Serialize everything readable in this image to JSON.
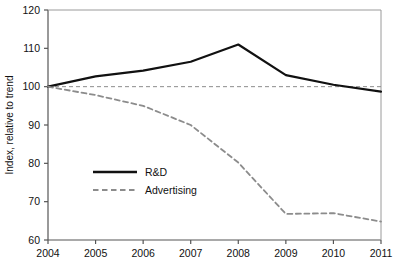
{
  "chart_data": {
    "type": "line",
    "title": "",
    "xlabel": "",
    "ylabel": "Index, relative to trend",
    "x": [
      2004,
      2005,
      2006,
      2007,
      2008,
      2009,
      2010,
      2011
    ],
    "xticklabels": [
      "2004",
      "2005",
      "2006",
      "2007",
      "2008",
      "2009",
      "2010",
      "2011"
    ],
    "yticklabels": [
      "60",
      "70",
      "80",
      "90",
      "100",
      "110",
      "120"
    ],
    "yticks": [
      60,
      70,
      80,
      90,
      100,
      110,
      120
    ],
    "ylim": [
      60,
      120
    ],
    "xlim": [
      2004,
      2011
    ],
    "grid": false,
    "legend_position": "center-left",
    "reference_line": {
      "value": 100,
      "style": "dashed",
      "color": "#8c8c8c"
    },
    "series": [
      {
        "name": "R&D",
        "style": "solid",
        "color": "#111111",
        "width": 2.2,
        "values": [
          100,
          102.7,
          104.2,
          106.5,
          111.0,
          103.0,
          100.5,
          98.7
        ]
      },
      {
        "name": "Advertising",
        "style": "dashed",
        "color": "#8c8c8c",
        "width": 1.8,
        "values": [
          100,
          97.8,
          95.0,
          90.0,
          80.2,
          66.8,
          67.0,
          64.8
        ]
      }
    ]
  },
  "legend": {
    "items": [
      {
        "label": "R&D",
        "swatch": "solid-line-swatch"
      },
      {
        "label": "Advertising",
        "swatch": "dashed-line-swatch"
      }
    ]
  },
  "axes": {
    "y_title": "Index, relative to trend"
  }
}
